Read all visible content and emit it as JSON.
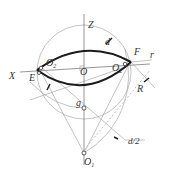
{
  "diagram": {
    "labels": {
      "Z": "Z",
      "X": "X",
      "E": "E",
      "F": "F",
      "O": "O",
      "O_left": "O",
      "O_left_sub": "2",
      "O_right": "O",
      "O_right_sub": "2",
      "O1": "O",
      "O1_sub": "1",
      "g": "g",
      "d": "d",
      "r": "r",
      "R": "R",
      "d_half": "d/2"
    },
    "colors": {
      "stroke_thick": "#1a1a1a",
      "stroke_thin": "#9a9a9a",
      "text": "#333333",
      "background": "#ffffff"
    }
  }
}
